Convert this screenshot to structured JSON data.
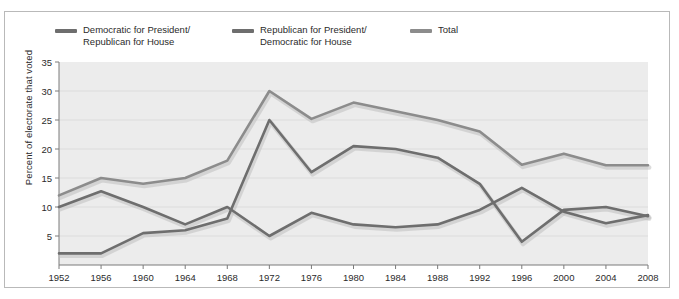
{
  "chart_data": {
    "type": "line",
    "title": "",
    "xlabel": "",
    "ylabel": "Percent of electorate that voted",
    "categories": [
      "1952",
      "1956",
      "1960",
      "1964",
      "1968",
      "1972",
      "1976",
      "1980",
      "1984",
      "1988",
      "1992",
      "1996",
      "2000",
      "2004",
      "2008"
    ],
    "x": [
      1952,
      1956,
      1960,
      1964,
      1968,
      1972,
      1976,
      1980,
      1984,
      1988,
      1992,
      1996,
      2000,
      2004,
      2008
    ],
    "xlim": [
      1952,
      2008
    ],
    "ylim": [
      0,
      35
    ],
    "yticks": [
      5,
      10,
      15,
      20,
      25,
      30,
      35
    ],
    "xticks": [
      "1952",
      "1956",
      "1960",
      "1964",
      "1968",
      "1972",
      "1976",
      "1980",
      "1984",
      "1988",
      "1992",
      "1996",
      "2000",
      "2004",
      "2008"
    ],
    "grid": true,
    "grid_axis": "y",
    "legend_position": "top",
    "series": [
      {
        "name": "Democratic for President/\nRepublican for House",
        "color": "#6e6e6e",
        "values": [
          10.0,
          12.7,
          10.0,
          7.0,
          10.0,
          5.0,
          9.0,
          7.0,
          6.5,
          7.0,
          9.5,
          13.3,
          9.2,
          7.2,
          8.6
        ]
      },
      {
        "name": "Republican for President/\nDemocratic for House",
        "color": "#6e6e6e",
        "values": [
          2.0,
          2.0,
          5.5,
          6.0,
          8.0,
          25.0,
          16.0,
          20.5,
          20.0,
          18.5,
          14.0,
          4.0,
          9.5,
          10.0,
          8.4
        ]
      },
      {
        "name": "Total",
        "color": "#8c8c8c",
        "values": [
          12.0,
          15.0,
          14.0,
          15.0,
          18.0,
          30.0,
          25.2,
          28.0,
          26.5,
          25.0,
          23.0,
          17.3,
          19.2,
          17.2,
          17.2
        ]
      }
    ]
  },
  "legend": {
    "items": [
      {
        "label": "Democratic for President/\nRepublican for House",
        "color": "#6e6e6e"
      },
      {
        "label": "Republican for President/\nDemocratic for House",
        "color": "#6e6e6e"
      },
      {
        "label": "Total",
        "color": "#8c8c8c"
      }
    ]
  },
  "axes": {
    "y_axis_title": "Percent of electorate that voted"
  },
  "style": {
    "plot_background": "#ececec",
    "grid_color": "#dcdcdc",
    "axis_color": "#7a7a7a",
    "text_color": "#2b2b2b",
    "figure_background": "#ffffff",
    "line_shadow": "#bfbfbf"
  }
}
